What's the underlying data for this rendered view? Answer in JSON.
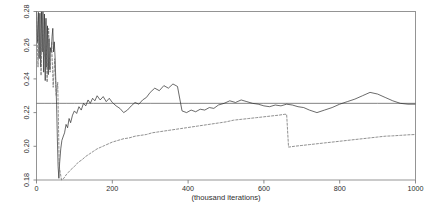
{
  "chart_data": {
    "type": "line",
    "title": "",
    "subtitle": "",
    "xlabel": "(thousand iterations)",
    "ylabel": "",
    "xlim": [
      0,
      1000
    ],
    "ylim": [
      0.18,
      0.28
    ],
    "grid": false,
    "legend": "none",
    "x_ticks": [
      "0",
      "200",
      "400",
      "600",
      "800",
      "1000"
    ],
    "x_tick_values": [
      0,
      200,
      400,
      600,
      800,
      1000
    ],
    "y_ticks": [
      "0.18",
      "0.20",
      "0.22",
      "0.24",
      "0.26",
      "0.28"
    ],
    "y_tick_values": [
      0.18,
      0.2,
      0.22,
      0.24,
      0.26,
      0.28
    ],
    "y_tick_rotation": 90,
    "colors": {
      "series_solid_flat": "#4d4d4d",
      "series_solid_jagged": "#2b2b2b",
      "series_dashed": "#6b6b6b",
      "frame": "#7a7a7a",
      "background": "#ffffff"
    },
    "series": [
      {
        "name": "running-mean-reference",
        "style": "solid",
        "x": [
          0,
          20,
          40,
          60,
          80,
          100,
          150,
          200,
          300,
          400,
          500,
          600,
          700,
          800,
          900,
          1000
        ],
        "values": [
          0.2255,
          0.2255,
          0.2255,
          0.2255,
          0.2255,
          0.2255,
          0.2255,
          0.2255,
          0.2255,
          0.2255,
          0.2255,
          0.2255,
          0.2255,
          0.2255,
          0.2255,
          0.2255
        ]
      },
      {
        "name": "chain-1-solid",
        "style": "solid",
        "x": [
          0,
          3,
          5,
          7,
          9,
          11,
          13,
          15,
          17,
          19,
          21,
          23,
          25,
          27,
          29,
          31,
          33,
          35,
          37,
          39,
          41,
          43,
          45,
          47,
          49,
          51,
          53,
          55,
          57,
          59,
          61,
          64,
          67,
          70,
          74,
          78,
          82,
          86,
          90,
          95,
          100,
          106,
          112,
          118,
          124,
          130,
          136,
          142,
          148,
          154,
          160,
          168,
          176,
          184,
          192,
          200,
          210,
          220,
          230,
          240,
          250,
          260,
          270,
          280,
          290,
          300,
          312,
          324,
          336,
          348,
          360,
          372,
          384,
          396,
          408,
          420,
          432,
          444,
          456,
          468,
          480,
          495,
          510,
          525,
          540,
          555,
          570,
          585,
          600,
          615,
          630,
          645,
          660,
          675,
          690,
          705,
          720,
          740,
          760,
          780,
          800,
          820,
          840,
          860,
          880,
          900,
          920,
          940,
          960,
          980,
          1000
        ],
        "values": [
          0.28,
          0.2615,
          0.2795,
          0.252,
          0.279,
          0.247,
          0.28,
          0.256,
          0.28,
          0.244,
          0.2785,
          0.239,
          0.276,
          0.247,
          0.2715,
          0.2425,
          0.264,
          0.2455,
          0.2585,
          0.256,
          0.265,
          0.27,
          0.256,
          0.262,
          0.253,
          0.238,
          0.225,
          0.205,
          0.188,
          0.181,
          0.19,
          0.1985,
          0.2035,
          0.2055,
          0.208,
          0.213,
          0.211,
          0.2165,
          0.214,
          0.2185,
          0.221,
          0.2195,
          0.2235,
          0.2215,
          0.2255,
          0.224,
          0.2275,
          0.2255,
          0.2285,
          0.227,
          0.23,
          0.2275,
          0.2295,
          0.2265,
          0.2285,
          0.226,
          0.224,
          0.2225,
          0.22,
          0.2215,
          0.224,
          0.226,
          0.225,
          0.2275,
          0.229,
          0.232,
          0.2345,
          0.233,
          0.236,
          0.2345,
          0.237,
          0.2355,
          0.221,
          0.22,
          0.2215,
          0.2205,
          0.222,
          0.2215,
          0.223,
          0.2225,
          0.2245,
          0.2255,
          0.227,
          0.226,
          0.2275,
          0.2265,
          0.2255,
          0.225,
          0.224,
          0.2235,
          0.2245,
          0.224,
          0.225,
          0.2245,
          0.2235,
          0.223,
          0.2215,
          0.22,
          0.2215,
          0.223,
          0.225,
          0.2265,
          0.228,
          0.23,
          0.232,
          0.231,
          0.229,
          0.227,
          0.2255,
          0.225,
          0.225
        ],
        "annotations": [
          "violent oscillation near 0.28 at start",
          "deep dip to 0.181 near x=59",
          "converges to about 0.225"
        ]
      },
      {
        "name": "chain-2-dashed",
        "style": "dashed",
        "x": [
          0,
          4,
          8,
          12,
          16,
          20,
          24,
          28,
          32,
          36,
          40,
          44,
          48,
          52,
          56,
          60,
          66,
          72,
          78,
          84,
          90,
          100,
          110,
          120,
          130,
          140,
          150,
          160,
          170,
          180,
          190,
          200,
          215,
          230,
          245,
          260,
          275,
          290,
          305,
          320,
          335,
          350,
          365,
          380,
          395,
          410,
          425,
          440,
          455,
          470,
          485,
          500,
          520,
          540,
          560,
          580,
          600,
          620,
          640,
          655,
          660,
          665,
          680,
          700,
          720,
          740,
          760,
          780,
          800,
          820,
          840,
          860,
          880,
          900,
          920,
          940,
          960,
          980,
          1000
        ],
        "values": [
          0.279,
          0.247,
          0.278,
          0.242,
          0.276,
          0.253,
          0.274,
          0.238,
          0.27,
          0.244,
          0.262,
          0.235,
          0.252,
          0.23,
          0.238,
          0.188,
          0.18,
          0.181,
          0.183,
          0.1845,
          0.186,
          0.188,
          0.1905,
          0.192,
          0.194,
          0.1955,
          0.197,
          0.1985,
          0.1995,
          0.2005,
          0.2015,
          0.2025,
          0.2035,
          0.2045,
          0.205,
          0.206,
          0.2065,
          0.207,
          0.208,
          0.2085,
          0.209,
          0.2095,
          0.21,
          0.2105,
          0.211,
          0.2115,
          0.212,
          0.2125,
          0.213,
          0.2135,
          0.214,
          0.2145,
          0.2155,
          0.216,
          0.2165,
          0.217,
          0.2175,
          0.218,
          0.2185,
          0.219,
          0.219,
          0.1995,
          0.2,
          0.2005,
          0.201,
          0.2015,
          0.202,
          0.2025,
          0.203,
          0.2035,
          0.204,
          0.2045,
          0.205,
          0.2055,
          0.206,
          0.2062,
          0.2065,
          0.2068,
          0.207
        ],
        "annotations": [
          "sharp vertical drop at x=660",
          "slow monotone rise toward 0.207"
        ]
      }
    ]
  }
}
